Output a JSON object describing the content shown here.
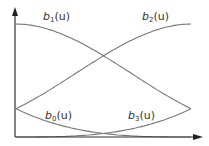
{
  "chart_data": {
    "type": "line",
    "title": "",
    "xlabel": "u",
    "ylabel": "",
    "xlim": [
      0,
      1
    ],
    "ylim": [
      0,
      0.6667
    ],
    "grid": false,
    "legend": "inline labels",
    "x": [
      0,
      0.25,
      0.5,
      0.75,
      1
    ],
    "series": [
      {
        "name": "b0(u)",
        "values": [
          0.1667,
          0.0703,
          0.0208,
          0.0026,
          0
        ]
      },
      {
        "name": "b1(u)",
        "values": [
          0.6667,
          0.612,
          0.4792,
          0.3151,
          0.1667
        ]
      },
      {
        "name": "b2(u)",
        "values": [
          0.1667,
          0.3151,
          0.4792,
          0.612,
          0.6667
        ]
      },
      {
        "name": "b3(u)",
        "values": [
          0,
          0.0026,
          0.0208,
          0.0703,
          0.1667
        ]
      }
    ]
  },
  "labels": {
    "b0": {
      "base": "b",
      "sub": "0",
      "arg": "(u)"
    },
    "b1": {
      "base": "b",
      "sub": "1",
      "arg": "(u)"
    },
    "b2": {
      "base": "b",
      "sub": "2",
      "arg": "(u)"
    },
    "b3": {
      "base": "b",
      "sub": "3",
      "arg": "(u)"
    }
  },
  "style": {
    "line_color": "#777777",
    "axis_color": "#333333"
  }
}
